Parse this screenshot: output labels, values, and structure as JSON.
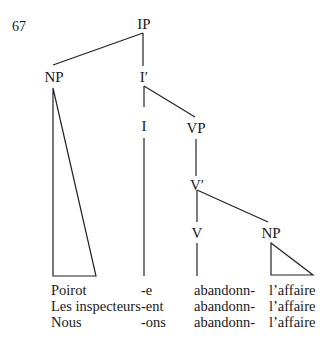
{
  "example_number": "67",
  "tree": {
    "nodes": {
      "ip": "IP",
      "np_subject": "NP",
      "i_bar": "I′",
      "i": "I",
      "vp": "VP",
      "v_bar": "V′",
      "v": "V",
      "np_object": "NP"
    }
  },
  "leaves": {
    "subject": [
      "Poirot",
      "Les inspecteurs",
      "Nous"
    ],
    "inflection": [
      "-e",
      "-ent",
      "-ons"
    ],
    "verb": [
      "abandonn-",
      "abandonn-",
      "abandonn-"
    ],
    "object": [
      "l’affaire",
      "l’affaire",
      "l’affaire"
    ]
  }
}
